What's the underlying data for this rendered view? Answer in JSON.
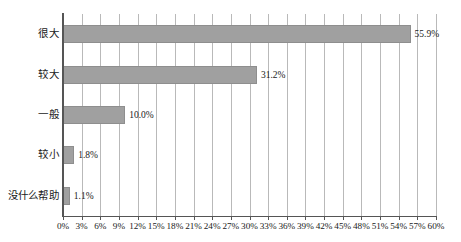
{
  "chart_data": {
    "type": "bar",
    "orientation": "horizontal",
    "title": "",
    "subtitle": "",
    "xlabel": "",
    "ylabel": "",
    "categories": [
      "很大",
      "较大",
      "一般",
      "较小",
      "没什么帮助"
    ],
    "values": [
      55.9,
      31.2,
      10.0,
      1.8,
      1.1
    ],
    "value_labels": [
      "55.9%",
      "31.2%",
      "10.0%",
      "1.8%",
      "1.1%"
    ],
    "xlim": [
      0,
      60
    ],
    "xtick_step": 3,
    "xticks": [
      0,
      3,
      6,
      9,
      12,
      15,
      18,
      21,
      24,
      27,
      30,
      33,
      36,
      39,
      42,
      45,
      48,
      51,
      54,
      57,
      60
    ],
    "xtick_labels": [
      "0%",
      "3%",
      "6%",
      "9%",
      "12%",
      "15%",
      "18%",
      "21%",
      "24%",
      "27%",
      "30%",
      "33%",
      "36%",
      "39%",
      "42%",
      "45%",
      "48%",
      "51%",
      "54%",
      "57%",
      "60%"
    ],
    "grid": "vertical",
    "legend": "none",
    "bar_color": "#a0a0a0",
    "bar_border_color": "#8e8e8e",
    "gridline_color": "#b9b9b9",
    "axis_color": "#555555",
    "background_color": "#ffffff",
    "text_color": "#1a1a1a"
  }
}
